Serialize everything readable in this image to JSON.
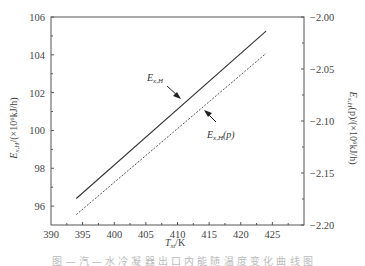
{
  "chart_data": {
    "type": "line",
    "title": "",
    "xlabel": "T_st/K",
    "ylabel": "E_x,H/(×10^6 kJ/h)",
    "ylabel_right": "E_x,H(p)/(×10^6 kJ/h)",
    "xlim": [
      390,
      430
    ],
    "ylim": [
      95,
      106
    ],
    "ylim_right": [
      -2.2,
      -2.0
    ],
    "x_ticks": [
      390,
      395,
      400,
      405,
      410,
      415,
      420,
      425
    ],
    "y_ticks": [
      96,
      98,
      100,
      102,
      104,
      106
    ],
    "y_ticks_right": [
      -2.0,
      -2.05,
      -2.1,
      -2.15,
      -2.2
    ],
    "grid": false,
    "series": [
      {
        "name": "E_x,H",
        "axis": "left",
        "style": "solid",
        "x": [
          394,
          424
        ],
        "values": [
          96.4,
          105.25
        ]
      },
      {
        "name": "E_x,H(p)",
        "axis": "right",
        "style": "dashed",
        "x": [
          394,
          424
        ],
        "values_left_scale": [
          95.85,
          104.4
        ],
        "values": [
          -2.19,
          -2.035
        ]
      }
    ],
    "annotations": [
      {
        "text": "E_x,H",
        "points_to": "solid line"
      },
      {
        "text": "E_x,H(p)",
        "points_to": "dashed line"
      }
    ]
  },
  "labels": {
    "x_title_main": "T",
    "x_title_sub": "st",
    "x_title_unit": "/K",
    "y_left_title": "E",
    "y_left_sub": "x,H",
    "y_left_unit": "/(×10⁶kJ/h)",
    "y_right_title": "E",
    "y_right_sub": "x,H",
    "y_right_unit": "(p)/(×10⁶kJ/h)",
    "annot1_main": "E",
    "annot1_sub": "x,H",
    "annot2_main": "E",
    "annot2_sub": "x,H",
    "annot2_suffix": "(p)"
  },
  "caption": "图 — 汽 — 水 冷 凝 器 出 口 内 能 随 温 度 变 化 曲 线 图"
}
